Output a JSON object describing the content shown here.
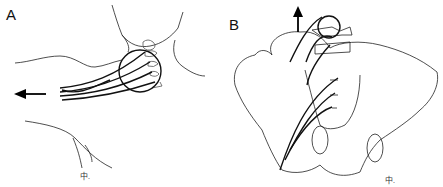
{
  "figure": {
    "panels": [
      {
        "label": "A",
        "subject": "brachial-plexus-traction",
        "signature": "中."
      },
      {
        "label": "B",
        "subject": "lumbosacral-plexus-traction",
        "signature": "中."
      }
    ],
    "colors": {
      "line": "#111111",
      "background": "#ffffff"
    }
  }
}
